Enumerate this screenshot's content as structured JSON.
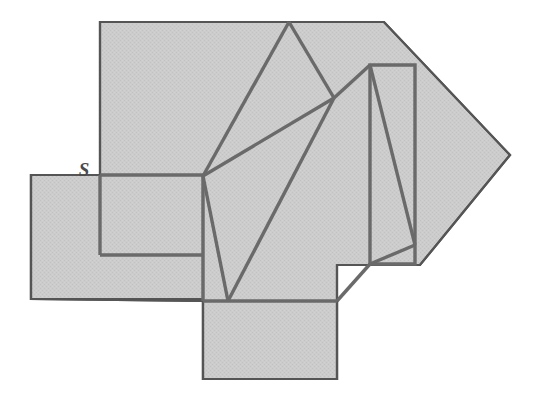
{
  "figure": {
    "canvas": {
      "width": 540,
      "height": 402
    },
    "colors": {
      "background": "#ffffff",
      "fill": "#c9c9c9",
      "outline": "#555555",
      "inner_line": "#666666",
      "label": "#4a4a4a"
    },
    "stroke_widths": {
      "outline": 2.2,
      "inner": 3.4
    },
    "labels": [
      {
        "text": "S",
        "x": 84,
        "y": 176
      }
    ],
    "shapes": {
      "main_polygon": {
        "name": "main-shaded-polygon",
        "points": "100,22 384,22 510,155 420,265 337,265 337,379 203,379 203,301 31,299 31,175 100,175"
      },
      "left_rectangle": {
        "name": "left-shaded-rectangle",
        "points": "31,175 203,175 203,299 31,299"
      },
      "bottom_rectangle": {
        "name": "bottom-shaded-rectangle",
        "points": "203,301 337,301 337,379 203,379"
      },
      "right_inner_rectangle": {
        "name": "right-inner-rectangle",
        "points": "370,65 415,65 415,264 370,264"
      }
    },
    "inner_lines": [
      {
        "name": "inner-line-apex-to-vertex",
        "x1": 289,
        "y1": 22,
        "x2": 203,
        "y2": 176
      },
      {
        "name": "inner-line-apex-to-hub",
        "x1": 289,
        "y1": 22,
        "x2": 334,
        "y2": 98
      },
      {
        "name": "inner-line-vertex-to-hub",
        "x1": 203,
        "y1": 176,
        "x2": 334,
        "y2": 98
      },
      {
        "name": "inner-line-hub-to-valley",
        "x1": 334,
        "y1": 98,
        "x2": 228,
        "y2": 301
      },
      {
        "name": "inner-line-vertex-to-valley",
        "x1": 203,
        "y1": 176,
        "x2": 228,
        "y2": 301
      },
      {
        "name": "inner-line-hub-to-rect-top",
        "x1": 334,
        "y1": 98,
        "x2": 370,
        "y2": 65
      },
      {
        "name": "inner-line-rect-diagonal",
        "x1": 370,
        "y1": 65,
        "x2": 415,
        "y2": 245
      },
      {
        "name": "inner-line-rect-lower-diagonal",
        "x1": 415,
        "y1": 245,
        "x2": 370,
        "y2": 264
      },
      {
        "name": "inner-line-rect-corner-to-bottom",
        "x1": 370,
        "y1": 264,
        "x2": 337,
        "y2": 301
      },
      {
        "name": "inner-line-left-rect-top",
        "x1": 100,
        "y1": 175,
        "x2": 203,
        "y2": 175
      },
      {
        "name": "inner-line-left-rect-vertical",
        "x1": 100,
        "y1": 175,
        "x2": 100,
        "y2": 255
      },
      {
        "name": "inner-line-left-rect-bottom",
        "x1": 100,
        "y1": 255,
        "x2": 203,
        "y2": 255
      },
      {
        "name": "inner-line-vertex-down",
        "x1": 203,
        "y1": 176,
        "x2": 203,
        "y2": 301
      },
      {
        "name": "inner-line-bottom-edge",
        "x1": 203,
        "y1": 301,
        "x2": 337,
        "y2": 301
      }
    ]
  }
}
